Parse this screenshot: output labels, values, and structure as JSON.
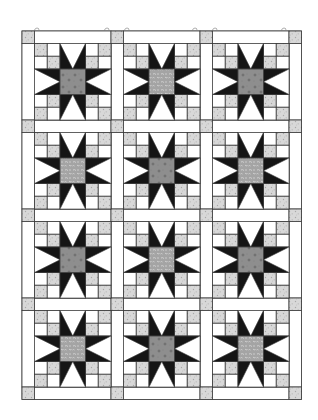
{
  "quilt": {
    "pattern_name": "Sawtooth Star with Four-Patch Corners",
    "layout": {
      "columns": 3,
      "rows": 4
    },
    "geometry": {
      "origin_x": 22,
      "origin_y": 31,
      "sashing_width": 12.5,
      "block_size": 76.5
    },
    "colors": {
      "background": "#ffffff",
      "outline": "#3a3a3a",
      "star_points": "#151515",
      "patch_light": "#d8d8d8",
      "patch_speckle": "#b5b5b5",
      "center_dotted": "#8c8c8c",
      "center_floral": "#a9a9a9",
      "floral_speckle": "#d6d6d6",
      "dot_mark": "#555555",
      "cornerstone": "#d0d0d0"
    },
    "center_types": [
      [
        "dotted",
        "floral",
        "dotted"
      ],
      [
        "floral",
        "dotted",
        "floral"
      ],
      [
        "dotted",
        "floral",
        "dotted"
      ],
      [
        "floral",
        "dotted",
        "floral"
      ]
    ],
    "hanging_marks_x": [
      37,
      107,
      127,
      195,
      215,
      284
    ]
  }
}
